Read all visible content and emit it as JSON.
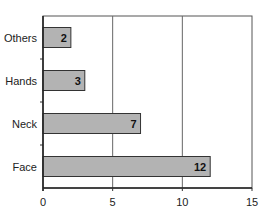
{
  "chart_data": {
    "type": "bar",
    "orientation": "horizontal",
    "title": "",
    "xlabel": "Patient numbers",
    "ylabel": "",
    "categories": [
      "Others",
      "Hands",
      "Neck",
      "Face"
    ],
    "values": [
      2,
      3,
      7,
      12
    ],
    "value_labels": [
      "2",
      "3",
      "7",
      "12"
    ],
    "xlim": [
      0,
      15
    ],
    "xticks": [
      0,
      5,
      10,
      15
    ],
    "xtick_labels": [
      "0",
      "5",
      "10",
      "15"
    ],
    "grid": {
      "x": true,
      "y": false
    },
    "legend": null,
    "bar_color": "#b3b3b3",
    "bar_edge_color": "#333333"
  }
}
